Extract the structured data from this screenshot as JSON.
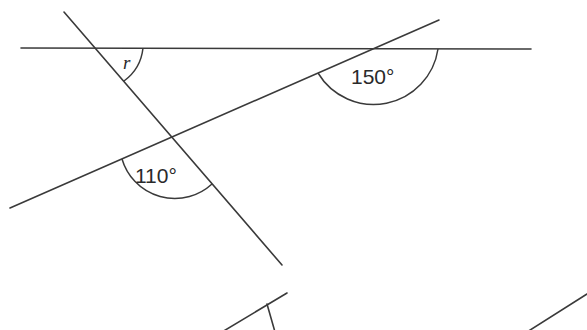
{
  "diagram": {
    "type": "angles-parallel-lines-transversal",
    "labels": {
      "unknown_angle": "r",
      "angle_top_right": "150°",
      "angle_bottom_left": "110°"
    },
    "angles": [
      {
        "name": "r",
        "value": null,
        "vertex": "top-left intersection (horizontal line & steep transversal)"
      },
      {
        "name": "150°",
        "value": 150,
        "vertex": "top-right intersection (horizontal line & sloped line)"
      },
      {
        "name": "110°",
        "value": 110,
        "vertex": "middle intersection (sloped line & steep transversal)"
      }
    ],
    "colors": {
      "line": "#3a3a3a",
      "text": "#2a2a2a",
      "background": "#ffffff"
    }
  }
}
